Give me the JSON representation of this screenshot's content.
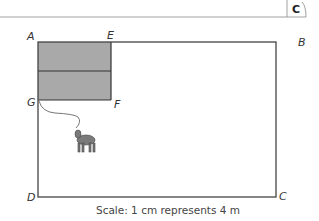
{
  "header": {
    "badge": "C"
  },
  "diagram": {
    "vertices": {
      "A": "A",
      "B": "B",
      "C": "C",
      "D": "D",
      "E": "E",
      "F": "F",
      "G": "G"
    },
    "caption": "Scale: 1 cm represents 4 m",
    "shaded_color": "#a9a9a9",
    "line_color": "#444444",
    "animal": "goat-tethered-at-G"
  }
}
